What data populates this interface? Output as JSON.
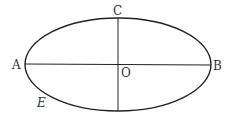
{
  "diagram": {
    "type": "ellipse-with-axes",
    "stroke_color": "#222222",
    "label_color": "#333333",
    "ellipse": {
      "cx": 118,
      "cy": 64.5,
      "rx": 93,
      "ry": 46.5,
      "name": "E"
    },
    "axes": {
      "major": {
        "from": "A",
        "to": "B"
      },
      "minor": {
        "from": "C",
        "to": "bottom"
      }
    },
    "labels": {
      "A": "A",
      "B": "B",
      "C": "C",
      "O": "O",
      "E": "E"
    }
  }
}
